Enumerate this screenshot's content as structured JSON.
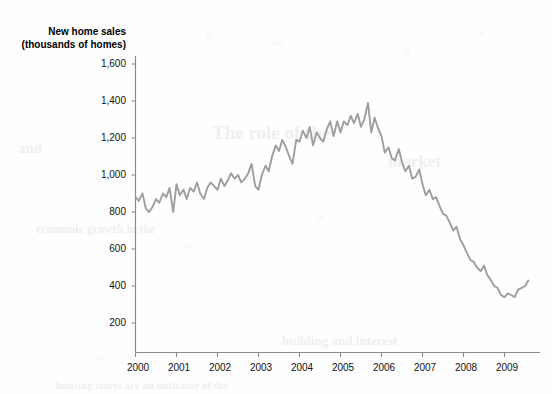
{
  "chart_data": {
    "type": "line",
    "title": "New home sales",
    "subtitle": "(thousands of homes)",
    "xlabel": "",
    "ylabel": "",
    "ylim": [
      0,
      1700
    ],
    "xlim": [
      2000.0,
      2009.75
    ],
    "grid": false,
    "legend": "none",
    "line_color": "#9e9e9e",
    "axis_color": "#8a8a8a",
    "text_color": "#111111",
    "y_ticks": [
      "200",
      "400",
      "600",
      "800",
      "1,000",
      "1,200",
      "1,400",
      "1,600"
    ],
    "y_tick_values": [
      200,
      400,
      600,
      800,
      1000,
      1200,
      1400,
      1600
    ],
    "x_ticks": [
      "2000",
      "2001",
      "2002",
      "2003",
      "2004",
      "2005",
      "2006",
      "2007",
      "2008",
      "2009"
    ],
    "x_tick_values": [
      2000,
      2001,
      2002,
      2003,
      2004,
      2005,
      2006,
      2007,
      2008,
      2009
    ],
    "series": [
      {
        "name": "New home sales",
        "x": [
          2000.0,
          2000.08,
          2000.17,
          2000.25,
          2000.33,
          2000.42,
          2000.5,
          2000.58,
          2000.67,
          2000.75,
          2000.83,
          2000.92,
          2001.0,
          2001.08,
          2001.17,
          2001.25,
          2001.33,
          2001.42,
          2001.5,
          2001.58,
          2001.67,
          2001.75,
          2001.83,
          2001.92,
          2002.0,
          2002.08,
          2002.17,
          2002.25,
          2002.33,
          2002.42,
          2002.5,
          2002.58,
          2002.67,
          2002.75,
          2002.83,
          2002.92,
          2003.0,
          2003.08,
          2003.17,
          2003.25,
          2003.33,
          2003.42,
          2003.5,
          2003.58,
          2003.67,
          2003.75,
          2003.83,
          2003.92,
          2004.0,
          2004.08,
          2004.17,
          2004.25,
          2004.33,
          2004.42,
          2004.5,
          2004.58,
          2004.67,
          2004.75,
          2004.83,
          2004.92,
          2005.0,
          2005.08,
          2005.17,
          2005.25,
          2005.33,
          2005.42,
          2005.5,
          2005.58,
          2005.67,
          2005.75,
          2005.83,
          2005.92,
          2006.0,
          2006.08,
          2006.17,
          2006.25,
          2006.33,
          2006.42,
          2006.5,
          2006.58,
          2006.67,
          2006.75,
          2006.83,
          2006.92,
          2007.0,
          2007.08,
          2007.17,
          2007.25,
          2007.33,
          2007.42,
          2007.5,
          2007.58,
          2007.67,
          2007.75,
          2007.83,
          2007.92,
          2008.0,
          2008.08,
          2008.17,
          2008.25,
          2008.33,
          2008.42,
          2008.5,
          2008.58,
          2008.67,
          2008.75,
          2008.83,
          2008.92,
          2009.0,
          2009.08,
          2009.17,
          2009.25,
          2009.33,
          2009.42,
          2009.5,
          2009.58
        ],
        "values": [
          880,
          860,
          900,
          820,
          800,
          830,
          870,
          850,
          900,
          880,
          930,
          800,
          950,
          890,
          920,
          870,
          930,
          910,
          960,
          900,
          870,
          930,
          960,
          940,
          920,
          980,
          940,
          970,
          1010,
          980,
          1000,
          960,
          980,
          1010,
          1060,
          940,
          920,
          1000,
          1050,
          1020,
          1100,
          1160,
          1130,
          1190,
          1150,
          1100,
          1060,
          1190,
          1180,
          1240,
          1200,
          1260,
          1160,
          1230,
          1200,
          1180,
          1250,
          1290,
          1210,
          1290,
          1230,
          1290,
          1270,
          1320,
          1280,
          1330,
          1260,
          1300,
          1390,
          1230,
          1310,
          1250,
          1210,
          1120,
          1150,
          1090,
          1080,
          1140,
          1070,
          1020,
          1050,
          980,
          990,
          1030,
          950,
          890,
          920,
          870,
          880,
          830,
          790,
          780,
          740,
          700,
          720,
          650,
          620,
          580,
          540,
          530,
          500,
          480,
          510,
          460,
          430,
          400,
          390,
          350,
          340,
          360,
          350,
          340,
          380,
          390,
          400,
          430
        ]
      }
    ]
  }
}
